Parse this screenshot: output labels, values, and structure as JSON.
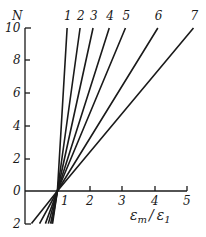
{
  "chart_data": {
    "type": "line",
    "title": "",
    "xlabel": "εm / ε1",
    "ylabel": "N",
    "xlim": [
      0,
      5
    ],
    "ylim": [
      -2,
      10
    ],
    "x_ticks": [
      "1",
      "2",
      "3",
      "4",
      "5"
    ],
    "y_ticks": [
      "0",
      "2",
      "4",
      "6",
      "8",
      "10"
    ],
    "y_tick_below_zero": "2",
    "grid": false,
    "legend": "inline numbered labels at line ends",
    "series": [
      {
        "name": "1",
        "x": [
          0.85,
          1.0,
          1.3
        ],
        "y": [
          -2,
          0,
          10
        ]
      },
      {
        "name": "2",
        "x": [
          0.83,
          1.0,
          1.7
        ],
        "y": [
          -2,
          0,
          10
        ]
      },
      {
        "name": "3",
        "x": [
          0.79,
          1.0,
          2.1
        ],
        "y": [
          -2,
          0,
          10
        ]
      },
      {
        "name": "4",
        "x": [
          0.72,
          1.0,
          2.6
        ],
        "y": [
          -2,
          0,
          10
        ]
      },
      {
        "name": "5",
        "x": [
          0.63,
          1.0,
          3.1
        ],
        "y": [
          -2,
          0,
          10
        ]
      },
      {
        "name": "6",
        "x": [
          0.45,
          1.0,
          4.1
        ],
        "y": [
          -2,
          0,
          10
        ]
      },
      {
        "name": "7",
        "x": [
          0.2,
          1.0,
          5.2
        ],
        "y": [
          -2,
          0,
          10
        ]
      }
    ]
  },
  "labels": {
    "y_axis": "N",
    "x_axis_em": "ε",
    "x_axis_sub_m": "m",
    "x_axis_slash": "/",
    "x_axis_e1": "ε",
    "x_axis_sub_1": "1"
  }
}
